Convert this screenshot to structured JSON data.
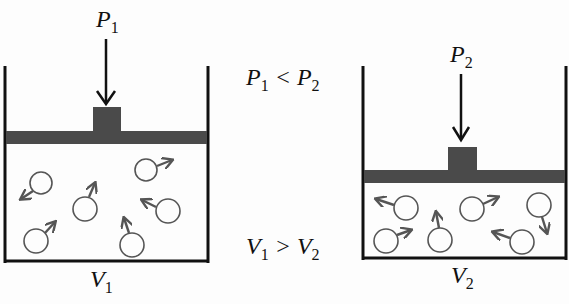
{
  "diagram": {
    "left_container": {
      "pressure_label": "P",
      "pressure_sub": "1",
      "volume_label": "V",
      "volume_sub": "1",
      "molecules": [
        {
          "cx": 41,
          "cy": 182,
          "dir": "down-left"
        },
        {
          "cx": 85,
          "cy": 209,
          "dir": "up"
        },
        {
          "cx": 146,
          "cy": 169,
          "dir": "right"
        },
        {
          "cx": 168,
          "cy": 211,
          "dir": "left"
        },
        {
          "cx": 36,
          "cy": 241,
          "dir": "up-right"
        },
        {
          "cx": 132,
          "cy": 244,
          "dir": "up"
        }
      ]
    },
    "right_container": {
      "pressure_label": "P",
      "pressure_sub": "2",
      "volume_label": "V",
      "volume_sub": "2",
      "molecules": [
        {
          "cx": 405,
          "cy": 208,
          "dir": "left"
        },
        {
          "cx": 440,
          "cy": 240,
          "dir": "up"
        },
        {
          "cx": 472,
          "cy": 208,
          "dir": "right"
        },
        {
          "cx": 539,
          "cy": 204,
          "dir": "down"
        },
        {
          "cx": 386,
          "cy": 241,
          "dir": "up-right"
        },
        {
          "cx": 522,
          "cy": 242,
          "dir": "left"
        }
      ]
    },
    "relations": {
      "pressure": {
        "a": "P",
        "a_sub": "1",
        "op": "<",
        "b": "P",
        "b_sub": "2"
      },
      "volume": {
        "a": "V",
        "a_sub": "1",
        "op": ">",
        "b": "V",
        "b_sub": "2"
      }
    },
    "colors": {
      "piston": "#4a4a4a",
      "wall": "#111111",
      "molecule_stroke": "#555555",
      "arrow": "#111111"
    }
  }
}
